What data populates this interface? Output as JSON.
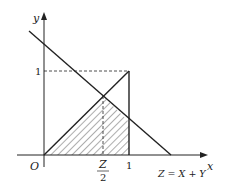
{
  "diagram": {
    "axes": {
      "x_label": "x",
      "y_label": "y",
      "origin_label": "O"
    },
    "ticks": {
      "x_one": "1",
      "y_one": "1",
      "z_half_num": "Z",
      "z_half_den": "2"
    },
    "line_label": "Z = X + Y",
    "colors": {
      "stroke": "#222222",
      "hatch": "#333333",
      "background": "#ffffff"
    }
  }
}
